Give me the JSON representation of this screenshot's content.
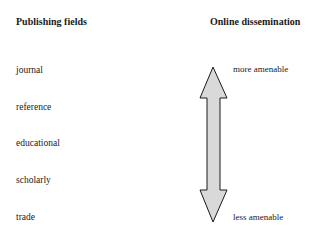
{
  "left_column": {
    "heading": "Publishing fields",
    "items": [
      {
        "label": "journal"
      },
      {
        "label": "reference"
      },
      {
        "label": "educational"
      },
      {
        "label": "scholarly"
      },
      {
        "label": "trade"
      }
    ]
  },
  "right_column": {
    "heading": "Online dissemination",
    "top_label": "more amenable",
    "bottom_label": "less amenable",
    "arrow": {
      "type": "double-headed vertical",
      "fill": "#d9d9d9",
      "stroke": "#1a1a1a"
    }
  }
}
